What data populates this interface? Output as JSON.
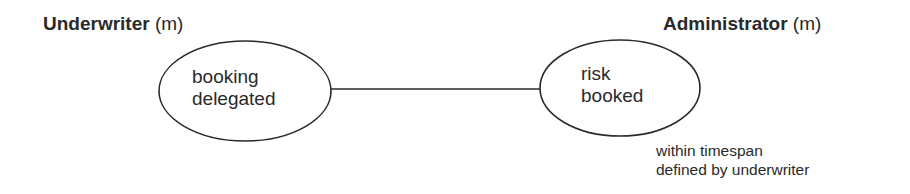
{
  "diagram": {
    "roles": [
      {
        "name": "Underwriter",
        "qualifier": "(m)"
      },
      {
        "name": "Administrator",
        "qualifier": "(m)"
      }
    ],
    "states": [
      {
        "line1": "booking",
        "line2": "delegated"
      },
      {
        "line1": "risk",
        "line2": "booked"
      }
    ],
    "note": {
      "line1": "within timespan",
      "line2": "defined by underwriter"
    },
    "colors": {
      "stroke": "#2a2a2a",
      "background": "#ffffff"
    }
  }
}
